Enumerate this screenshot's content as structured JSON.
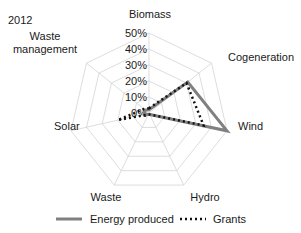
{
  "chart_data": {
    "type": "radar",
    "title": "2012",
    "categories": [
      "Biomass",
      "Cogeneration",
      "Wind",
      "Hydro",
      "Waste",
      "Solar",
      "Waste management"
    ],
    "axis_ticks": [
      "0%",
      "10%",
      "20%",
      "30%",
      "40%",
      "50%"
    ],
    "rlim": [
      0,
      50
    ],
    "grid": true,
    "legend_position": "bottom",
    "series": [
      {
        "name": "Energy produced",
        "style": "solid",
        "color": "#808080",
        "values": [
          2,
          31,
          50,
          1,
          1,
          3,
          3
        ]
      },
      {
        "name": "Grants",
        "style": "dotted",
        "color": "#111111",
        "values": [
          3,
          30,
          35,
          1,
          1,
          20,
          4
        ]
      }
    ]
  },
  "title": "2012",
  "legend": {
    "energy_label": "Energy produced",
    "grants_label": "Grants"
  }
}
